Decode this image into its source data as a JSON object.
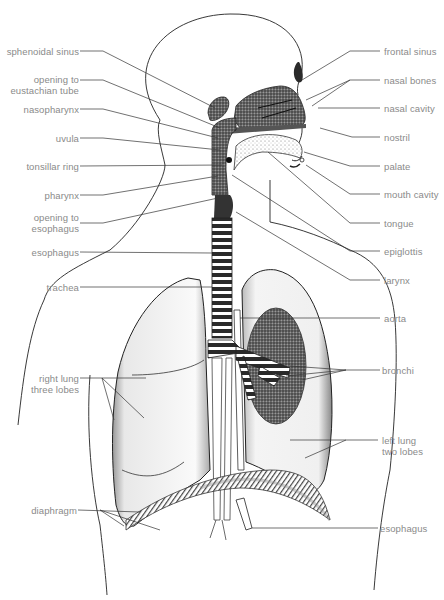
{
  "colors": {
    "background": "#ffffff",
    "label_text": "#8a8a8a",
    "leader_line": "#333333",
    "outline": "#222222",
    "shading": "#9a9a9a",
    "dark_fill": "#2a2a2a"
  },
  "labels": {
    "left": [
      {
        "id": "sphenoidal-sinus",
        "text": "sphenoidal sinus",
        "x": 3,
        "y": 46,
        "w": 76
      },
      {
        "id": "opening-eustachian-tube",
        "text": "opening to\neustachian tube",
        "x": 3,
        "y": 74,
        "w": 76
      },
      {
        "id": "nasopharynx",
        "text": "nasopharynx",
        "x": 3,
        "y": 104,
        "w": 76
      },
      {
        "id": "uvula",
        "text": "uvula",
        "x": 3,
        "y": 133,
        "w": 76
      },
      {
        "id": "tonsillar-ring",
        "text": "tonsillar ring",
        "x": 3,
        "y": 161,
        "w": 76
      },
      {
        "id": "pharynx",
        "text": "pharynx",
        "x": 3,
        "y": 190,
        "w": 76
      },
      {
        "id": "opening-esophagus",
        "text": "opening to\nesophagus",
        "x": 3,
        "y": 218,
        "w": 76
      },
      {
        "id": "esophagus-upper",
        "text": "esophagus",
        "x": 3,
        "y": 247,
        "w": 76
      },
      {
        "id": "trachea",
        "text": "trachea",
        "x": 3,
        "y": 280,
        "w": 76
      },
      {
        "id": "right-lung",
        "text": "right lung\nthree lobes",
        "x": 3,
        "y": 373,
        "w": 76
      },
      {
        "id": "diaphragm",
        "text": "diaphragm",
        "x": 3,
        "y": 505,
        "w": 74
      }
    ],
    "right": [
      {
        "id": "frontal-sinus",
        "text": "frontal sinus",
        "x": 384,
        "y": 46
      },
      {
        "id": "nasal-bones",
        "text": "nasal bones",
        "x": 384,
        "y": 75
      },
      {
        "id": "nasal-cavity",
        "text": "nasal cavity",
        "x": 384,
        "y": 103
      },
      {
        "id": "nostril",
        "text": "nostril",
        "x": 384,
        "y": 132
      },
      {
        "id": "palate",
        "text": "palate",
        "x": 384,
        "y": 161
      },
      {
        "id": "mouth-cavity",
        "text": "mouth cavity",
        "x": 384,
        "y": 189
      },
      {
        "id": "tongue",
        "text": "tongue",
        "x": 384,
        "y": 218
      },
      {
        "id": "epiglottis",
        "text": "epiglottis",
        "x": 384,
        "y": 246
      },
      {
        "id": "larynx",
        "text": "larynx",
        "x": 384,
        "y": 275
      },
      {
        "id": "aorta",
        "text": "aorta",
        "x": 384,
        "y": 313
      },
      {
        "id": "bronchi",
        "text": "bronchi",
        "x": 382,
        "y": 365
      },
      {
        "id": "left-lung",
        "text": "left lung\ntwo lobes",
        "x": 382,
        "y": 434
      },
      {
        "id": "esophagus-lower",
        "text": "esophagus",
        "x": 380,
        "y": 523
      }
    ]
  }
}
